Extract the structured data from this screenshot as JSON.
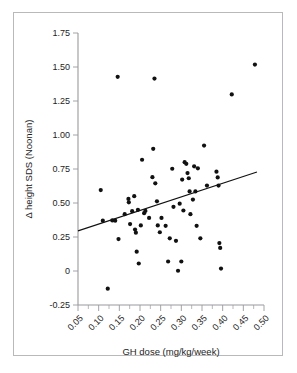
{
  "figure": {
    "border_color": "#b9b9bb",
    "background": "#ffffff"
  },
  "chart_data": {
    "type": "scatter",
    "title": "",
    "xlabel": "GH dose (mg/kg/week)",
    "ylabel": "Δ height SDS (Noonan)",
    "xlim": [
      0.05,
      0.5
    ],
    "ylim": [
      -0.25,
      1.75
    ],
    "grid": false,
    "legend": null,
    "xticks": [
      0.05,
      0.1,
      0.15,
      0.2,
      0.25,
      0.3,
      0.35,
      0.4,
      0.45,
      0.5
    ],
    "xtick_labels": [
      "0.05",
      "0.10",
      "0.15",
      "0.20",
      "0.25",
      "0.30",
      "0.35",
      "0.40",
      "0.45",
      "0.50"
    ],
    "xtick_rotation": 45,
    "yticks": [
      -0.25,
      0,
      0.25,
      0.5,
      0.75,
      1.0,
      1.25,
      1.5,
      1.75
    ],
    "ytick_labels": [
      "-0.25",
      "0",
      "0.25",
      "0.50",
      "0.75",
      "1.00",
      "1.25",
      "1.50",
      "1.75"
    ],
    "x_minor_tick_step": 0.025,
    "marker": {
      "shape": "circle",
      "color": "#111111",
      "size": 2.1
    },
    "points": [
      {
        "x": 0.105,
        "y": 0.595
      },
      {
        "x": 0.11,
        "y": 0.37
      },
      {
        "x": 0.122,
        "y": -0.13
      },
      {
        "x": 0.133,
        "y": 0.372
      },
      {
        "x": 0.14,
        "y": 0.37
      },
      {
        "x": 0.146,
        "y": 1.428
      },
      {
        "x": 0.148,
        "y": 0.235
      },
      {
        "x": 0.163,
        "y": 0.418
      },
      {
        "x": 0.172,
        "y": 0.53
      },
      {
        "x": 0.173,
        "y": 0.505
      },
      {
        "x": 0.176,
        "y": 0.345
      },
      {
        "x": 0.181,
        "y": 0.44
      },
      {
        "x": 0.186,
        "y": 0.55
      },
      {
        "x": 0.188,
        "y": 0.305
      },
      {
        "x": 0.19,
        "y": 0.282
      },
      {
        "x": 0.192,
        "y": 0.142
      },
      {
        "x": 0.195,
        "y": 0.45
      },
      {
        "x": 0.197,
        "y": 0.055
      },
      {
        "x": 0.202,
        "y": 0.335
      },
      {
        "x": 0.205,
        "y": 0.818
      },
      {
        "x": 0.21,
        "y": 0.425
      },
      {
        "x": 0.213,
        "y": 0.442
      },
      {
        "x": 0.222,
        "y": 0.39
      },
      {
        "x": 0.23,
        "y": 0.69
      },
      {
        "x": 0.232,
        "y": 0.898
      },
      {
        "x": 0.235,
        "y": 1.415
      },
      {
        "x": 0.237,
        "y": 0.645
      },
      {
        "x": 0.241,
        "y": 0.512
      },
      {
        "x": 0.243,
        "y": 0.335
      },
      {
        "x": 0.248,
        "y": 0.285
      },
      {
        "x": 0.252,
        "y": 0.39
      },
      {
        "x": 0.262,
        "y": 0.332
      },
      {
        "x": 0.268,
        "y": 0.07
      },
      {
        "x": 0.272,
        "y": 0.24
      },
      {
        "x": 0.278,
        "y": 0.752
      },
      {
        "x": 0.281,
        "y": 0.472
      },
      {
        "x": 0.287,
        "y": 0.222
      },
      {
        "x": 0.292,
        "y": 0.002
      },
      {
        "x": 0.296,
        "y": 0.495
      },
      {
        "x": 0.3,
        "y": 0.07
      },
      {
        "x": 0.302,
        "y": 0.672
      },
      {
        "x": 0.305,
        "y": 0.445
      },
      {
        "x": 0.308,
        "y": 0.8
      },
      {
        "x": 0.312,
        "y": 0.788
      },
      {
        "x": 0.315,
        "y": 0.72
      },
      {
        "x": 0.318,
        "y": 0.682
      },
      {
        "x": 0.32,
        "y": 0.585
      },
      {
        "x": 0.322,
        "y": 0.418
      },
      {
        "x": 0.328,
        "y": 0.525
      },
      {
        "x": 0.331,
        "y": 0.77
      },
      {
        "x": 0.334,
        "y": 0.585
      },
      {
        "x": 0.337,
        "y": 0.332
      },
      {
        "x": 0.34,
        "y": 0.755
      },
      {
        "x": 0.346,
        "y": 0.24
      },
      {
        "x": 0.355,
        "y": 0.922
      },
      {
        "x": 0.362,
        "y": 0.628
      },
      {
        "x": 0.385,
        "y": 0.73
      },
      {
        "x": 0.388,
        "y": 0.688
      },
      {
        "x": 0.39,
        "y": 0.628
      },
      {
        "x": 0.392,
        "y": 0.205
      },
      {
        "x": 0.394,
        "y": 0.17
      },
      {
        "x": 0.396,
        "y": 0.018
      },
      {
        "x": 0.422,
        "y": 1.298
      },
      {
        "x": 0.478,
        "y": 1.518
      }
    ],
    "trend_line": {
      "x0": 0.05,
      "y0": 0.295,
      "x1": 0.483,
      "y1": 0.728,
      "color": "#111111"
    }
  }
}
